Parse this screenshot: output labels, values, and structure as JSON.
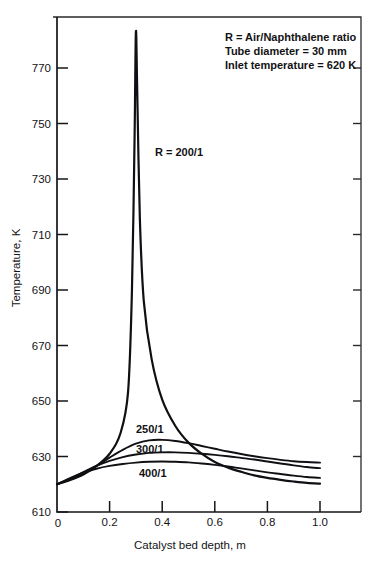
{
  "chart_data": {
    "type": "line",
    "title": "",
    "xlabel": "Catalyst bed depth, m",
    "ylabel": "Temperature, K",
    "xlim": [
      0,
      1.0
    ],
    "ylim": [
      610,
      790
    ],
    "grid": false,
    "legend_position": "inline-curve-labels",
    "xticks": [
      "0",
      "0.2",
      "0.4",
      "0.6",
      "0.8",
      "1.0"
    ],
    "xtick_values": [
      0,
      0.2,
      0.4,
      0.6,
      0.8,
      1.0
    ],
    "yticks": [
      "610",
      "630",
      "650",
      "670",
      "690",
      "710",
      "730",
      "750",
      "770"
    ],
    "ytick_values": [
      610,
      630,
      650,
      670,
      690,
      710,
      730,
      750,
      770
    ],
    "annotations": [
      "R = Air/Naphthalene ratio",
      "Tube diameter = 30 mm",
      "Inlet temperature = 620 K"
    ],
    "series": [
      {
        "name": "R = 200/1",
        "label": "R = 200/1",
        "x": [
          0.0,
          0.05,
          0.1,
          0.15,
          0.2,
          0.24,
          0.27,
          0.285,
          0.295,
          0.3,
          0.305,
          0.315,
          0.33,
          0.36,
          0.4,
          0.45,
          0.5,
          0.55,
          0.6,
          0.65,
          0.7,
          0.75,
          0.8,
          0.85,
          0.9,
          0.95,
          1.0
        ],
        "y": [
          620.0,
          621.5,
          623.5,
          626.5,
          631.0,
          638.0,
          653.0,
          690.0,
          745.0,
          783.0,
          762.0,
          716.0,
          686.0,
          665.0,
          650.5,
          641.0,
          635.0,
          631.0,
          628.0,
          626.0,
          624.5,
          623.2,
          622.3,
          621.6,
          621.0,
          620.5,
          620.2
        ]
      },
      {
        "name": "250/1",
        "label": "250/1",
        "x": [
          0.0,
          0.05,
          0.1,
          0.15,
          0.2,
          0.25,
          0.3,
          0.35,
          0.4,
          0.45,
          0.5,
          0.55,
          0.6,
          0.65,
          0.7,
          0.75,
          0.8,
          0.85,
          0.9,
          0.95,
          1.0
        ],
        "y": [
          620.0,
          621.8,
          624.0,
          626.6,
          629.6,
          632.4,
          634.6,
          635.8,
          636.0,
          635.6,
          634.8,
          633.8,
          632.8,
          631.8,
          630.9,
          630.1,
          629.4,
          628.8,
          628.3,
          628.0,
          627.8
        ]
      },
      {
        "name": "300/1",
        "label": "300/1",
        "x": [
          0.0,
          0.05,
          0.1,
          0.15,
          0.2,
          0.25,
          0.3,
          0.35,
          0.4,
          0.45,
          0.5,
          0.55,
          0.6,
          0.65,
          0.7,
          0.75,
          0.8,
          0.85,
          0.9,
          0.95,
          1.0
        ],
        "y": [
          620.0,
          622.0,
          624.4,
          626.6,
          628.4,
          629.8,
          630.7,
          631.3,
          631.5,
          631.5,
          631.3,
          631.0,
          630.6,
          630.1,
          629.5,
          628.9,
          628.2,
          627.5,
          626.8,
          626.2,
          625.8
        ]
      },
      {
        "name": "400/1",
        "label": "400/1",
        "x": [
          0.0,
          0.05,
          0.1,
          0.15,
          0.2,
          0.25,
          0.3,
          0.35,
          0.4,
          0.45,
          0.5,
          0.55,
          0.6,
          0.65,
          0.7,
          0.75,
          0.8,
          0.85,
          0.9,
          0.95,
          1.0
        ],
        "y": [
          620.0,
          622.2,
          624.2,
          625.6,
          626.6,
          627.3,
          627.8,
          628.1,
          628.2,
          628.1,
          627.9,
          627.5,
          627.0,
          626.4,
          625.7,
          625.0,
          624.3,
          623.7,
          623.1,
          622.6,
          622.3
        ]
      }
    ]
  },
  "series_label_positions": [
    {
      "key": "R = 200/1",
      "x": 155,
      "y": 156
    },
    {
      "key": "250/1",
      "x": 136,
      "y": 433
    },
    {
      "key": "300/1",
      "x": 136,
      "y": 453
    },
    {
      "key": "400/1",
      "x": 139,
      "y": 477
    }
  ],
  "annotation_position": {
    "x": 225,
    "y": 41,
    "line_height": 14
  }
}
